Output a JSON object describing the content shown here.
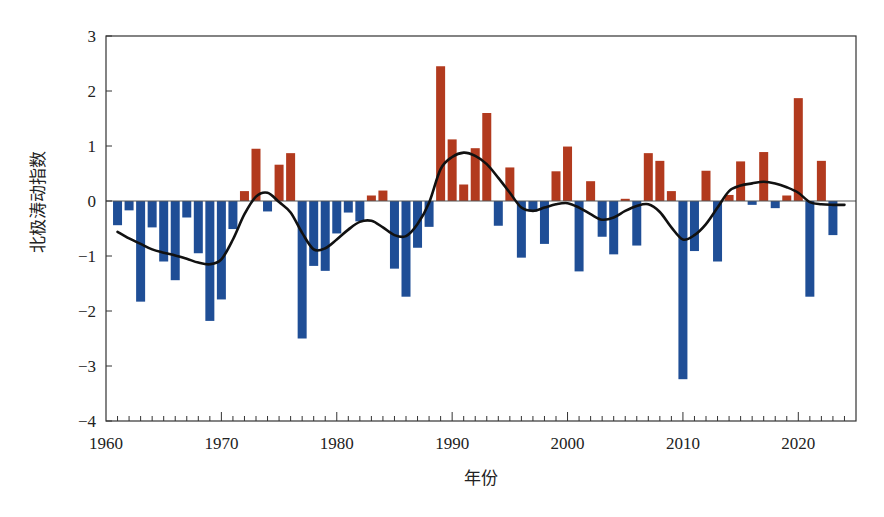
{
  "chart_data": {
    "type": "bar",
    "title": "",
    "xlabel": "年份",
    "ylabel": "北极涛动指数",
    "xlim": [
      1960,
      2025
    ],
    "ylim": [
      -4,
      3
    ],
    "x_ticks": [
      1960,
      1970,
      1980,
      1990,
      2000,
      2010,
      2020
    ],
    "y_ticks": [
      -4,
      -3,
      -2,
      -1,
      0,
      1,
      2,
      3
    ],
    "grid": false,
    "legend": null,
    "colors": {
      "positive": "#b23a1e",
      "negative": "#1f4e96",
      "smooth_line": "#111111"
    },
    "categories": [
      1961,
      1962,
      1963,
      1964,
      1965,
      1966,
      1967,
      1968,
      1969,
      1970,
      1971,
      1972,
      1973,
      1974,
      1975,
      1976,
      1977,
      1978,
      1979,
      1980,
      1981,
      1982,
      1983,
      1984,
      1985,
      1986,
      1987,
      1988,
      1989,
      1990,
      1991,
      1992,
      1993,
      1994,
      1995,
      1996,
      1997,
      1998,
      1999,
      2000,
      2001,
      2002,
      2003,
      2004,
      2005,
      2006,
      2007,
      2008,
      2009,
      2010,
      2011,
      2012,
      2013,
      2014,
      2015,
      2016,
      2017,
      2018,
      2019,
      2020,
      2021,
      2022,
      2023
    ],
    "series": [
      {
        "name": "北极涛动指数",
        "type": "bar",
        "values": [
          -0.44,
          -0.17,
          -1.83,
          -0.48,
          -1.1,
          -1.44,
          -0.3,
          -0.95,
          -2.18,
          -1.79,
          -0.51,
          0.18,
          0.95,
          -0.19,
          0.66,
          0.87,
          -2.5,
          -1.18,
          -1.27,
          -0.59,
          -0.21,
          -0.37,
          0.1,
          0.19,
          -1.23,
          -1.74,
          -0.85,
          -0.47,
          2.45,
          1.12,
          0.3,
          0.96,
          1.6,
          -0.45,
          0.61,
          -1.03,
          -0.19,
          -0.78,
          0.54,
          0.99,
          -1.28,
          0.36,
          -0.65,
          -0.97,
          0.04,
          -0.81,
          0.87,
          0.73,
          0.18,
          -3.24,
          -0.91,
          0.55,
          -1.1,
          0.11,
          0.72,
          -0.07,
          0.89,
          -0.13,
          0.1,
          1.87,
          -1.74,
          0.73,
          -0.62
        ]
      },
      {
        "name": "平滑曲线",
        "type": "line",
        "x": [
          1961,
          1962,
          1963,
          1964,
          1965,
          1966,
          1967,
          1968,
          1969,
          1970,
          1971,
          1972,
          1973,
          1974,
          1975,
          1976,
          1977,
          1978,
          1979,
          1980,
          1981,
          1982,
          1983,
          1984,
          1985,
          1986,
          1987,
          1988,
          1989,
          1990,
          1991,
          1992,
          1993,
          1994,
          1995,
          1996,
          1997,
          1998,
          1999,
          2000,
          2001,
          2002,
          2003,
          2004,
          2005,
          2006,
          2007,
          2008,
          2009,
          2010,
          2011,
          2012,
          2013,
          2014,
          2015,
          2016,
          2017,
          2018,
          2019,
          2020,
          2021,
          2022,
          2023,
          2024
        ],
        "values": [
          -0.56,
          -0.68,
          -0.78,
          -0.88,
          -0.94,
          -0.99,
          -1.05,
          -1.12,
          -1.15,
          -1.06,
          -0.7,
          -0.24,
          0.08,
          0.15,
          -0.02,
          -0.21,
          -0.58,
          -0.88,
          -0.86,
          -0.7,
          -0.52,
          -0.38,
          -0.36,
          -0.48,
          -0.62,
          -0.64,
          -0.42,
          -0.03,
          0.58,
          0.8,
          0.88,
          0.82,
          0.67,
          0.42,
          0.15,
          -0.12,
          -0.18,
          -0.12,
          -0.06,
          -0.04,
          -0.12,
          -0.24,
          -0.34,
          -0.3,
          -0.18,
          -0.09,
          -0.06,
          -0.2,
          -0.48,
          -0.7,
          -0.62,
          -0.42,
          -0.12,
          0.18,
          0.28,
          0.32,
          0.35,
          0.32,
          0.25,
          0.15,
          -0.02,
          -0.06,
          -0.07,
          -0.07
        ]
      }
    ]
  },
  "axes": {
    "xlabel": "年份",
    "ylabel": "北极涛动指数"
  }
}
